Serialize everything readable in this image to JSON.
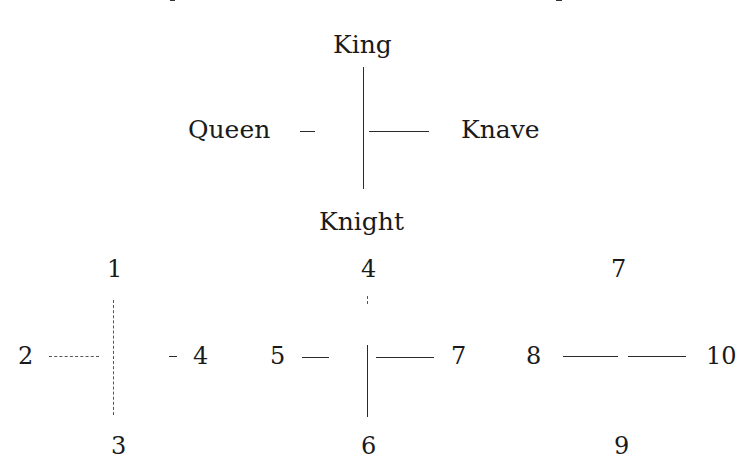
{
  "diagram": {
    "top_cross": {
      "top": "King",
      "left": "Queen",
      "right": "Knave",
      "bottom": "Knight"
    },
    "crosses": [
      {
        "top": "1",
        "left": "2",
        "right": "4",
        "bottom": "3"
      },
      {
        "top": "4",
        "left": "5",
        "right": "7",
        "bottom": "6"
      },
      {
        "top": "7",
        "left": "8",
        "right": "10",
        "bottom": "9"
      }
    ]
  },
  "colors": {
    "ink": "#1a1a1a",
    "background": "#ffffff"
  }
}
